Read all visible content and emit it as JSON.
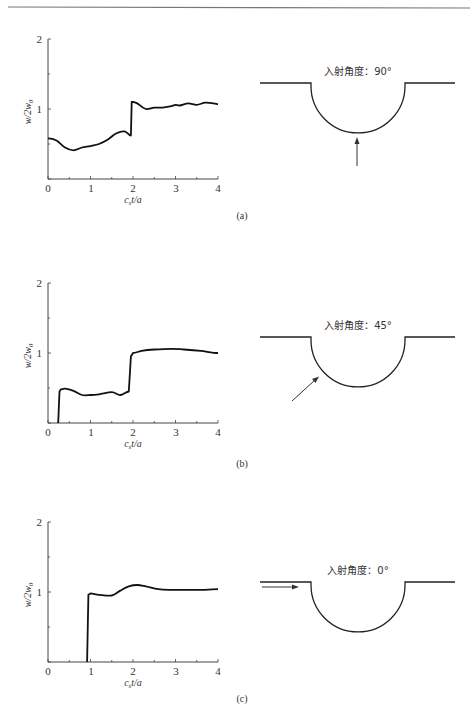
{
  "header_rule": true,
  "panels": [
    {
      "id": "a",
      "caption": "(a)",
      "diagram_label": "入射角度：90°",
      "incidence_angle_deg": 90,
      "y_tick_labels": [
        "2",
        "1"
      ],
      "x_tick_labels": [
        "0",
        "1",
        "2",
        "3",
        "4"
      ],
      "ylabel": "w/2w₀",
      "xlabel": "c_s t/a"
    },
    {
      "id": "b",
      "caption": "(b)",
      "diagram_label": "入射角度：45°",
      "incidence_angle_deg": 45,
      "y_tick_labels": [
        "2",
        "1"
      ],
      "x_tick_labels": [
        "0",
        "1",
        "2",
        "3",
        "4"
      ],
      "ylabel": "w/2w₀",
      "xlabel": "c_s t/a"
    },
    {
      "id": "c",
      "caption": "(c)",
      "diagram_label": "入射角度：0°",
      "incidence_angle_deg": 0,
      "y_tick_labels": [
        "2",
        "1"
      ],
      "x_tick_labels": [
        "0",
        "1",
        "2",
        "3",
        "4"
      ],
      "ylabel": "w/2w₀",
      "xlabel": "c_s t/a"
    }
  ],
  "chart_data": [
    {
      "type": "line",
      "title": "(a) 入射角度：90°",
      "xlabel": "c_s t/a",
      "ylabel": "w/2w_0",
      "xlim": [
        0,
        4
      ],
      "ylim": [
        0,
        2
      ],
      "xticks": [
        0,
        1,
        2,
        3,
        4
      ],
      "yticks": [
        0,
        1,
        2
      ],
      "grid": false,
      "series": [
        {
          "name": "w/2w0",
          "x": [
            0,
            0.2,
            0.4,
            0.6,
            0.8,
            1.0,
            1.2,
            1.4,
            1.6,
            1.8,
            1.95,
            1.97,
            2.0,
            2.1,
            2.3,
            2.5,
            2.7,
            2.9,
            3.0,
            3.1,
            3.3,
            3.5,
            3.7,
            3.9,
            4.0
          ],
          "y": [
            0.58,
            0.55,
            0.45,
            0.41,
            0.45,
            0.47,
            0.5,
            0.56,
            0.65,
            0.68,
            0.62,
            1.1,
            1.1,
            1.08,
            1.0,
            1.02,
            1.02,
            1.04,
            1.06,
            1.05,
            1.08,
            1.06,
            1.09,
            1.08,
            1.07
          ]
        }
      ]
    },
    {
      "type": "line",
      "title": "(b) 入射角度：45°",
      "xlabel": "c_s t/a",
      "ylabel": "w/2w_0",
      "xlim": [
        0,
        4
      ],
      "ylim": [
        0,
        2
      ],
      "xticks": [
        0,
        1,
        2,
        3,
        4
      ],
      "yticks": [
        0,
        1,
        2
      ],
      "grid": false,
      "series": [
        {
          "name": "w/2w0",
          "x": [
            0.24,
            0.27,
            0.3,
            0.4,
            0.6,
            0.8,
            1.0,
            1.2,
            1.5,
            1.7,
            1.9,
            1.95,
            2.0,
            2.2,
            2.5,
            2.9,
            3.2,
            3.6,
            4.0
          ],
          "y": [
            0.0,
            0.45,
            0.48,
            0.49,
            0.46,
            0.4,
            0.4,
            0.41,
            0.44,
            0.4,
            0.45,
            0.95,
            1.0,
            1.03,
            1.05,
            1.06,
            1.05,
            1.03,
            1.0
          ]
        }
      ]
    },
    {
      "type": "line",
      "title": "(c) 入射角度：0°",
      "xlabel": "c_s t/a",
      "ylabel": "w/2w_0",
      "xlim": [
        0,
        4
      ],
      "ylim": [
        0,
        2
      ],
      "xticks": [
        0,
        1,
        2,
        3,
        4
      ],
      "yticks": [
        0,
        1,
        2
      ],
      "grid": false,
      "series": [
        {
          "name": "w/2w0",
          "x": [
            0.92,
            0.95,
            1.0,
            1.2,
            1.5,
            1.7,
            1.9,
            2.1,
            2.3,
            2.6,
            2.9,
            3.2,
            3.6,
            4.0
          ],
          "y": [
            0.0,
            0.96,
            0.98,
            0.96,
            0.95,
            1.02,
            1.08,
            1.1,
            1.08,
            1.04,
            1.03,
            1.03,
            1.03,
            1.04
          ]
        }
      ]
    }
  ]
}
